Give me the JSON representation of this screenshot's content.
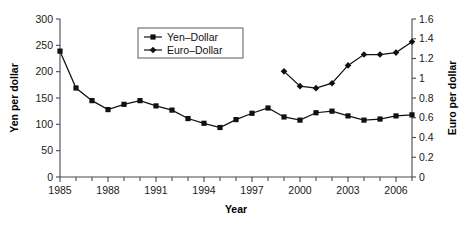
{
  "chart_data": {
    "type": "line",
    "title": "",
    "xlabel": "Year",
    "ylabel": "Yen per dollar",
    "y2label": "Euro per dollar",
    "xlim": [
      1985,
      2007
    ],
    "ylim": [
      0,
      300
    ],
    "y2lim": [
      0,
      1.6
    ],
    "grid": false,
    "legend_position": "top-center",
    "x_tick_labels": [
      "1985",
      "1988",
      "1991",
      "1994",
      "1997",
      "2000",
      "2003",
      "2006"
    ],
    "x_tick_values": [
      1985,
      1988,
      1991,
      1994,
      1997,
      2000,
      2003,
      2006
    ],
    "x_minor_ticks": [
      1986,
      1987,
      1989,
      1990,
      1992,
      1993,
      1995,
      1996,
      1998,
      1999,
      2001,
      2002,
      2004,
      2005,
      2007
    ],
    "y_tick_labels": [
      "0",
      "50",
      "100",
      "150",
      "200",
      "250",
      "300"
    ],
    "y_tick_values": [
      0,
      50,
      100,
      150,
      200,
      250,
      300
    ],
    "y2_tick_labels": [
      "0",
      "0.2",
      "0.4",
      "0.6",
      "0.8",
      "1",
      "1.2",
      "1.4",
      "1.6"
    ],
    "y2_tick_values": [
      0,
      0.2,
      0.4,
      0.6,
      0.8,
      1.0,
      1.2,
      1.4,
      1.6
    ],
    "series": [
      {
        "name": "Yen-Dollar",
        "axis": "left",
        "marker": "square",
        "color": "#111111",
        "x": [
          1985,
          1986,
          1987,
          1988,
          1989,
          1990,
          1991,
          1992,
          1993,
          1994,
          1995,
          1996,
          1997,
          1998,
          1999,
          2000,
          2001,
          2002,
          2003,
          2004,
          2005,
          2006,
          2007
        ],
        "values": [
          239,
          169,
          145,
          128,
          138,
          145,
          135,
          127,
          111,
          102,
          94,
          109,
          121,
          131,
          114,
          108,
          122,
          125,
          116,
          108,
          110,
          116,
          118
        ]
      },
      {
        "name": "Euro-Dollar",
        "axis": "right",
        "marker": "diamond",
        "color": "#111111",
        "x": [
          1999,
          2000,
          2001,
          2002,
          2003,
          2004,
          2005,
          2006,
          2007
        ],
        "values": [
          1.07,
          0.92,
          0.9,
          0.95,
          1.13,
          1.24,
          1.24,
          1.26,
          1.37
        ]
      }
    ],
    "legend": [
      {
        "label": "Yen-Dollar",
        "marker": "square"
      },
      {
        "label": "Euro-Dollar",
        "marker": "diamond"
      }
    ]
  }
}
